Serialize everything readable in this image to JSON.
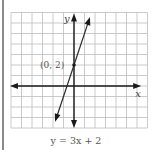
{
  "chart_data": {
    "type": "line",
    "title": "",
    "caption": "y = 3x + 2",
    "xlabel": "x",
    "ylabel": "y",
    "grid": true,
    "xlim": [
      -6,
      7
    ],
    "ylim": [
      -4,
      7
    ],
    "equation": {
      "slope": 3,
      "intercept": 2
    },
    "series": [
      {
        "name": "y = 3x + 2",
        "x": [
          -1.8,
          1.52
        ],
        "y": [
          -3.4,
          6.56
        ]
      }
    ],
    "annotations": [
      {
        "label": "(0, 2)",
        "x": 0,
        "y": 2
      }
    ],
    "axes_extent": {
      "x": [
        -6.1,
        6.4
      ],
      "y": [
        -4,
        6.9
      ]
    }
  }
}
